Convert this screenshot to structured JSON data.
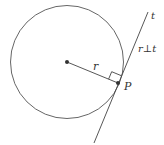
{
  "diagram": {
    "labels": {
      "radius": "r",
      "tangent": "t",
      "point": "P",
      "relation": "r⊥t"
    },
    "colors": {
      "stroke": "#444444",
      "text": "#333333"
    }
  }
}
